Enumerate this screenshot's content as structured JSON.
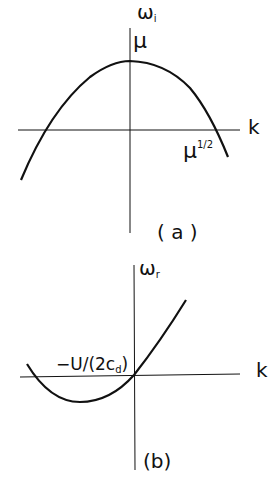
{
  "panels": [
    {
      "id": "a",
      "caption": "( a )",
      "y_axis_label": "ω",
      "y_axis_label_sub": "i",
      "x_axis_label": "k",
      "peak_label": "μ",
      "root_label_base": "μ",
      "root_label_exp": "1/2",
      "curve": "downward parabola, peak μ at k=0, roots at ±μ^(1/2)"
    },
    {
      "id": "b",
      "caption": "(b)",
      "y_axis_label": "ω",
      "y_axis_label_sub": "r",
      "x_axis_label": "k",
      "slope_label_main": "−U/(2c",
      "slope_label_sub": "d",
      "slope_label_end": ")",
      "curve": "upward parabola through origin, minimum at negative k"
    }
  ],
  "colors": {
    "line": "#111111",
    "background": "#ffffff"
  }
}
